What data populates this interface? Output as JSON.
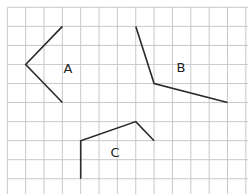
{
  "diagram": {
    "type": "grid-polylines",
    "background": "#ffffff",
    "grid": {
      "color": "#c9c9c9",
      "origin_x": 7.3,
      "origin_y": 7.3,
      "cell_width": 18.35,
      "cell_height": 19.05,
      "columns": 13,
      "rows": 10
    },
    "line_color": "#2a2a2a",
    "shapes": [
      {
        "label": "A",
        "points": [
          [
            3,
            1
          ],
          [
            1,
            3
          ],
          [
            3,
            5
          ]
        ],
        "label_pos": [
          68,
          73
        ]
      },
      {
        "label": "B",
        "points": [
          [
            7,
            1
          ],
          [
            8,
            4
          ],
          [
            12,
            5
          ]
        ],
        "label_pos": [
          181,
          72
        ]
      },
      {
        "label": "C",
        "points": [
          [
            4,
            9
          ],
          [
            4,
            7
          ],
          [
            7,
            6
          ],
          [
            8,
            7
          ]
        ],
        "label_pos": [
          115,
          157
        ]
      }
    ]
  }
}
